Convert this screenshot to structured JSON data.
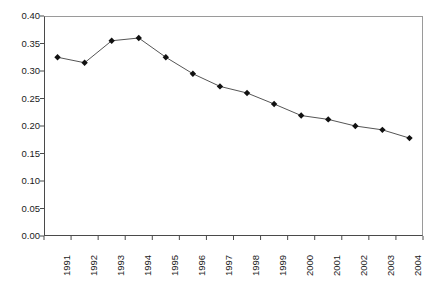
{
  "chart_data": {
    "type": "line",
    "title": "",
    "subtitle": "",
    "xlabel": "",
    "ylabel": "",
    "categories": [
      "1991",
      "1992",
      "1993",
      "1994",
      "1995",
      "1996",
      "1997",
      "1998",
      "1999",
      "2000",
      "2001",
      "2002",
      "2003",
      "2004"
    ],
    "values": [
      0.325,
      0.315,
      0.355,
      0.36,
      0.325,
      0.295,
      0.272,
      0.26,
      0.24,
      0.219,
      0.212,
      0.2,
      0.193,
      0.178
    ],
    "series": [
      {
        "name": "",
        "values": [
          0.325,
          0.315,
          0.355,
          0.36,
          0.325,
          0.295,
          0.272,
          0.26,
          0.24,
          0.219,
          0.212,
          0.2,
          0.193,
          0.178
        ]
      }
    ],
    "ylim": [
      0.0,
      0.4
    ],
    "yticks": [
      "0.00",
      "0.05",
      "0.10",
      "0.15",
      "0.20",
      "0.25",
      "0.30",
      "0.35",
      "0.40"
    ],
    "ytick_values": [
      0.0,
      0.05,
      0.1,
      0.15,
      0.2,
      0.25,
      0.3,
      0.35,
      0.4
    ],
    "xticks": [
      "1991",
      "1992",
      "1993",
      "1994",
      "1995",
      "1996",
      "1997",
      "1998",
      "1999",
      "2000",
      "2001",
      "2002",
      "2003",
      "2004"
    ],
    "grid": false,
    "legend": "none",
    "annotations": [],
    "colors": {
      "line": "#555555",
      "marker": "#111111",
      "axis": "#4a4a4a",
      "frame": "#9a9a9a",
      "background": "#ffffff",
      "text": "#1a1a1a"
    },
    "marker": "diamond"
  }
}
